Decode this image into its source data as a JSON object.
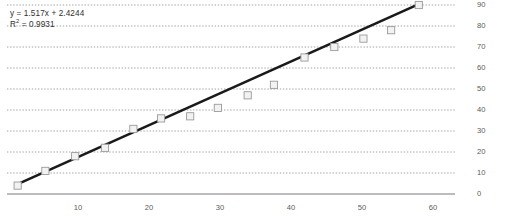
{
  "chart_data": {
    "type": "scatter",
    "title": "",
    "xlabel": "",
    "ylabel": "",
    "xlim": [
      0,
      65
    ],
    "ylim": [
      0,
      95
    ],
    "grid": true,
    "legend": "none",
    "x": [
      1.5,
      5.4,
      9.6,
      13.8,
      17.8,
      21.7,
      25.8,
      29.7,
      33.9,
      37.6,
      41.9,
      46.1,
      50.2,
      54.1,
      58.0
    ],
    "y": [
      4,
      11,
      18,
      22,
      31,
      36,
      37,
      41,
      47,
      52,
      65,
      70,
      74,
      78,
      90
    ],
    "points": [
      {
        "x": 1.5,
        "y": 4
      },
      {
        "x": 5.4,
        "y": 11
      },
      {
        "x": 9.6,
        "y": 18
      },
      {
        "x": 13.8,
        "y": 22
      },
      {
        "x": 17.8,
        "y": 31
      },
      {
        "x": 21.7,
        "y": 36
      },
      {
        "x": 25.8,
        "y": 37
      },
      {
        "x": 29.7,
        "y": 41
      },
      {
        "x": 33.9,
        "y": 47
      },
      {
        "x": 37.6,
        "y": 52
      },
      {
        "x": 41.9,
        "y": 65
      },
      {
        "x": 46.1,
        "y": 70
      },
      {
        "x": 50.2,
        "y": 74
      },
      {
        "x": 54.1,
        "y": 78
      },
      {
        "x": 58.0,
        "y": 90
      }
    ],
    "trendline": {
      "slope": 1.517,
      "intercept": 2.4244,
      "r_squared": 0.9931,
      "equation_label": "y = 1.517x + 2.4244",
      "r_squared_label_prefix": "R",
      "r_squared_label_sup": "2",
      "r_squared_label_value": " = 0.9931"
    },
    "x_ticks": [
      10,
      20,
      30,
      40,
      50,
      60
    ],
    "x_tick_labels": [
      "10",
      "20",
      "30",
      "40",
      "50",
      "60"
    ],
    "y_ticks": [
      0,
      10,
      20,
      30,
      40,
      50,
      60,
      70,
      80,
      90
    ],
    "y_tick_labels": [
      "0",
      "10",
      "20",
      "30",
      "40",
      "50",
      "60",
      "70",
      "80",
      "90"
    ],
    "y_axis_position": "right",
    "colors": {
      "trendline": "#1a1a1a",
      "marker_fill": "#f2f2f2",
      "marker_stroke": "#9a9a9a",
      "gridline": "#8c8c8c",
      "axis": "#7a7a7a",
      "text": "#5a5a5a",
      "annotation_text": "#2f2f2f"
    }
  }
}
